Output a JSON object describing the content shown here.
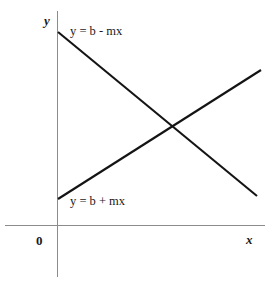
{
  "chart_data": {
    "type": "line",
    "title": "",
    "subtitle": "",
    "xlabel": "x",
    "ylabel": "y",
    "xlim": [
      0,
      100
    ],
    "ylim": [
      0,
      100
    ],
    "grid": false,
    "legend_position": "inline-annotations",
    "axes": {
      "x_axis_label": "x",
      "y_axis_label": "y",
      "origin_label": "0",
      "show_ticks": false,
      "show_tick_labels": false,
      "axis_color": "#8c8c8c"
    },
    "series": [
      {
        "name": "y = b - mx",
        "label": "y = b - mx",
        "annotation": "y = b - mx",
        "slope_sign": "negative",
        "color": "#141414",
        "x": [
          0,
          100
        ],
        "y": [
          95,
          15
        ],
        "pixel_endpoints": [
          [
            58,
            32
          ],
          [
            257,
            196
          ]
        ]
      },
      {
        "name": "y = b + mx",
        "label": "y = b + mx",
        "annotation": "y = b + mx",
        "slope_sign": "positive",
        "color": "#141414",
        "x": [
          0,
          100
        ],
        "y": [
          13,
          74
        ],
        "pixel_endpoints": [
          [
            58,
            199
          ],
          [
            261,
            70
          ]
        ]
      }
    ],
    "intersection": {
      "x": 57,
      "y": 48,
      "pixel": [
        172,
        125
      ]
    },
    "annotations": [
      {
        "text": "y = b - mx",
        "target_series": "y = b - mx"
      },
      {
        "text": "y = b + mx",
        "target_series": "y = b + mx"
      }
    ]
  },
  "colors": {
    "background": "#ffffff",
    "axis": "#8c8c8c",
    "line": "#141414",
    "text": "#1a1a1a"
  }
}
